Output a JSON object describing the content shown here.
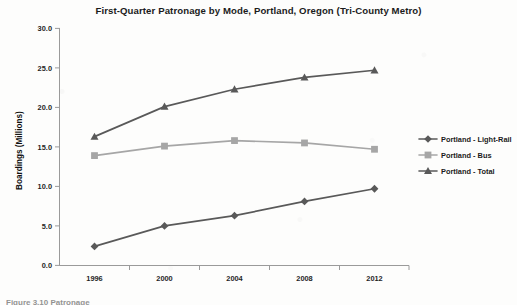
{
  "chart_data": {
    "type": "line",
    "title": "First-Quarter Patronage by Mode, Portland, Oregon (Tri-County Metro)",
    "xlabel": "",
    "ylabel": "Boardings (Millions)",
    "categories": [
      "1996",
      "2000",
      "2004",
      "2008",
      "2012"
    ],
    "x_tick_labels": [
      "1996",
      "2000",
      "2004",
      "2008",
      "2012"
    ],
    "y_tick_labels": [
      "0.0",
      "5.0",
      "10.0",
      "15.0",
      "20.0",
      "25.0",
      "30.0"
    ],
    "y_ticks": [
      0.0,
      5.0,
      10.0,
      15.0,
      20.0,
      25.0,
      30.0
    ],
    "ylim": [
      0.0,
      30.0
    ],
    "grid": false,
    "legend_position": "right",
    "series": [
      {
        "name": "Portland - Light-Rail",
        "values": [
          2.4,
          5.0,
          6.3,
          8.1,
          9.7
        ],
        "color": "#595959",
        "marker": "diamond"
      },
      {
        "name": "Portland - Bus",
        "values": [
          13.9,
          15.1,
          15.8,
          15.5,
          14.7
        ],
        "color": "#a6a6a6",
        "marker": "square"
      },
      {
        "name": "Portland - Total",
        "values": [
          16.3,
          20.1,
          22.3,
          23.8,
          24.7
        ],
        "color": "#595959",
        "marker": "triangle"
      }
    ]
  },
  "legend": {
    "items": [
      {
        "label": "Portland - Light-Rail"
      },
      {
        "label": "Portland - Bus"
      },
      {
        "label": "Portland - Total"
      }
    ]
  },
  "caption": {
    "text": "Figure 3.10  Patronage"
  }
}
